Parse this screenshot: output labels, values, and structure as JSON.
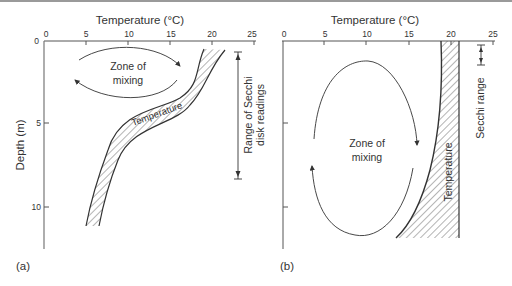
{
  "figure": {
    "panel_a": {
      "label": "(a)",
      "x_title": "Temperature (°C)",
      "y_title": "Depth (m)",
      "x_ticks": [
        "0",
        "5",
        "10",
        "15",
        "20",
        "25"
      ],
      "y_ticks": [
        "0",
        "5",
        "10"
      ],
      "zone_label_line1": "Zone of",
      "zone_label_line2": "mixing",
      "band_label": "Temperature",
      "secchi_label_line1": "Range of Secchi",
      "secchi_label_line2": "disk readings"
    },
    "panel_b": {
      "label": "(b)",
      "x_title": "Temperature (°C)",
      "x_ticks": [
        "0",
        "5",
        "10",
        "15",
        "20",
        "25"
      ],
      "zone_label_line1": "Zone of",
      "zone_label_line2": "mixing",
      "band_label": "Temperature",
      "secchi_label": "Secchi range"
    }
  },
  "colors": {
    "line": "#333333",
    "axis": "#555555",
    "hatch": "#444444"
  }
}
